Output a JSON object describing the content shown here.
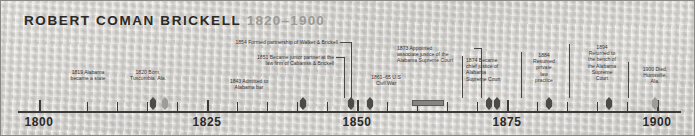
{
  "figure": {
    "title_name": "ROBERT COMAN BRICKELL",
    "title_years": "1820–1900",
    "background_color": "#d9d7d3",
    "ink_color": "#2b2a28"
  },
  "axis": {
    "range": [
      1795,
      1905
    ],
    "labels": [
      "1800",
      "1825",
      "1850",
      "1875",
      "1900"
    ],
    "label_years": [
      1800,
      1825,
      1850,
      1875,
      1900
    ],
    "minor_tick_years": [
      1805,
      1810,
      1815,
      1820,
      1830,
      1835,
      1840,
      1845,
      1855,
      1860,
      1865,
      1870,
      1880,
      1885,
      1890,
      1895
    ]
  },
  "events": [
    {
      "id": "alabama-statehood",
      "year": 1819,
      "label": "1819 Alabama\nbecame a state",
      "marker": "solid"
    },
    {
      "id": "born-tuscumbia",
      "year": 1820,
      "label": "1820 Born,\nTuscumbia, Ala.",
      "marker": "hollow"
    },
    {
      "id": "admitted-to-bar",
      "year": 1843,
      "label": "1843 Admitted to\nAlabama bar",
      "marker": "solid"
    },
    {
      "id": "junior-partner-cabaniss-brickell",
      "year": 1851,
      "label": "1851 Became junior partner at the\nlaw firm of Cabaniss & Brickell",
      "marker": "solid"
    },
    {
      "id": "partnership-walker-brickell",
      "year": 1854,
      "label": "1854 Formed partnership of Walker & Brickell",
      "marker": "solid"
    },
    {
      "id": "civil-war",
      "year_start": 1861,
      "year_end": 1865,
      "label": "1861–65 U.S\nCivil War",
      "marker": "span"
    },
    {
      "id": "associate-justice",
      "year": 1873,
      "label": "1873 Appointed\nassociate justice of the\nAlabama Supreme Court",
      "marker": "solid"
    },
    {
      "id": "chief-justice",
      "year": 1874,
      "label": "1874 Became\nchief justice of\nAlabama\nSupreme Court",
      "marker": "solid"
    },
    {
      "id": "private-law-practice",
      "year": 1884,
      "label": "1884\nResumed\nprivate\nlaw\npractice",
      "marker": "solid"
    },
    {
      "id": "returned-to-bench",
      "year": 1894,
      "label": "1894\nReturned to\nthe bench of\nthe Alabama\nSupreme\nCourt",
      "marker": "solid"
    },
    {
      "id": "died-huntsville",
      "year": 1900,
      "label": "1900 Died,\nHuntsville,\nAla.",
      "marker": "hollow"
    }
  ]
}
